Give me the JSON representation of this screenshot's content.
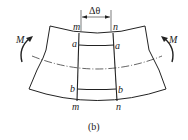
{
  "figure": {
    "caption": "(b)",
    "labels": {
      "moment_left": "M",
      "moment_right": "M",
      "delta_theta": "Δθ",
      "m_top": "m",
      "n_top": "n",
      "a_left": "a",
      "a_right": "a",
      "b_left": "b",
      "b_right": "b",
      "m_bottom": "m",
      "n_bottom": "n"
    },
    "colors": {
      "stroke": "#222222",
      "background": "#ffffff"
    }
  }
}
